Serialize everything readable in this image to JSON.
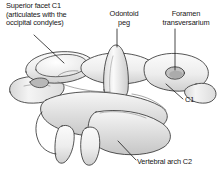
{
  "figure": {
    "background_color": "#ffffff",
    "line_color": "#2b2b2b",
    "bone_fill_light": "#f2f2f2",
    "bone_fill_mid": "#e0e0e0",
    "bone_fill_dark": "#c9c9c9"
  },
  "labels": {
    "superior_facet": {
      "line1": "Superior facet C1",
      "line2": "(articulates with the",
      "line3": "occipital condyles)"
    },
    "odontoid_peg": {
      "line1": "Odontoid",
      "line2": "peg"
    },
    "foramen_transversarium": {
      "line1": "Foramen",
      "line2": "transversarium"
    },
    "c1": "C1",
    "vertebral_arch_c2": "Vertebral arch C2"
  }
}
